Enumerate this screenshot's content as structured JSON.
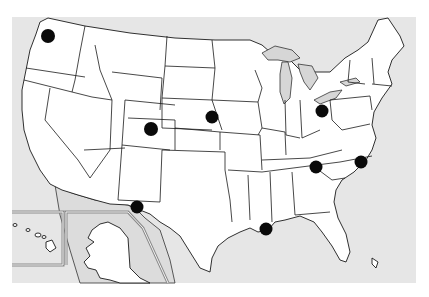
{
  "map": {
    "title": "",
    "region": "United States",
    "colors": {
      "background": "#ffffff",
      "ocean_and_neighbors": "#e6e6e6",
      "states_fill": "#ffffff",
      "border": "#1a1a1a",
      "marker": "#0a0a0a",
      "inset_frame": "#8a8a8a"
    },
    "insets": [
      "Hawaii",
      "Alaska"
    ],
    "markers": [
      {
        "id": "washington",
        "location": "Washington (northwest)",
        "x": 48,
        "y": 36,
        "r": 8
      },
      {
        "id": "colorado",
        "location": "Colorado",
        "x": 151,
        "y": 129,
        "r": 8
      },
      {
        "id": "nebraska",
        "location": "Eastern Nebraska",
        "x": 212,
        "y": 117,
        "r": 7
      },
      {
        "id": "ohio",
        "location": "Northern Ohio",
        "x": 322,
        "y": 111,
        "r": 7
      },
      {
        "id": "georgia-sc",
        "location": "Georgia / South Carolina border",
        "x": 316,
        "y": 167,
        "r": 7
      },
      {
        "id": "north-carolina",
        "location": "Eastern North Carolina",
        "x": 361,
        "y": 162,
        "r": 7
      },
      {
        "id": "new-mexico-texas",
        "location": "New Mexico / Texas border (El Paso)",
        "x": 137,
        "y": 207,
        "r": 7
      },
      {
        "id": "louisiana",
        "location": "Southeast Louisiana (New Orleans)",
        "x": 266,
        "y": 229,
        "r": 7
      }
    ]
  }
}
